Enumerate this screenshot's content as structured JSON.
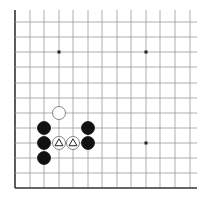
{
  "board": {
    "x_lines": [
      15,
      30,
      44,
      59,
      73,
      88,
      102,
      117,
      131,
      146,
      160,
      175,
      190
    ],
    "y_lines": [
      22,
      37,
      52,
      67,
      83,
      98,
      113,
      128,
      143,
      158,
      173,
      188
    ],
    "edge_left": true,
    "edge_bottom": true,
    "line_color": "#999999",
    "edge_color": "#333333",
    "stone_radius": 6.5,
    "star_points": [
      {
        "col": 3,
        "row": 2
      },
      {
        "col": 9,
        "row": 2
      },
      {
        "col": 9,
        "row": 8
      }
    ],
    "stones": [
      {
        "color": "white",
        "col": 3,
        "row": 6,
        "marker": null
      },
      {
        "color": "black",
        "col": 2,
        "row": 7,
        "marker": null
      },
      {
        "color": "black",
        "col": 2,
        "row": 8,
        "marker": null
      },
      {
        "color": "black",
        "col": 2,
        "row": 9,
        "marker": null
      },
      {
        "color": "white",
        "col": 3,
        "row": 8,
        "marker": "triangle"
      },
      {
        "color": "white",
        "col": 4,
        "row": 8,
        "marker": "triangle"
      },
      {
        "color": "black",
        "col": 5,
        "row": 7,
        "marker": null
      },
      {
        "color": "black",
        "col": 5,
        "row": 8,
        "marker": null
      }
    ]
  }
}
